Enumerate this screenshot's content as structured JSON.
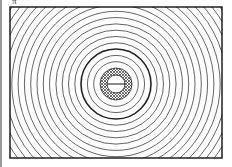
{
  "figure": {
    "label": "π",
    "frame": {
      "x": 10,
      "y": 7,
      "width": 212,
      "height": 151
    },
    "center": {
      "x": 116,
      "y": 84
    },
    "ring_spacing": 6.3,
    "thick_ring_radius": 35,
    "annulus": {
      "inner_radius": 9,
      "outer_radius": 16
    },
    "colors": {
      "line": "#222222",
      "background": "#ffffff",
      "hatch": "#444444"
    }
  }
}
